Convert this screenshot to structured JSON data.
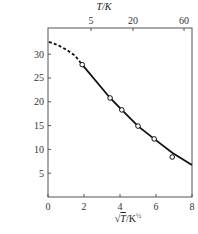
{
  "chart_data": {
    "type": "line",
    "title": "",
    "top_axis": {
      "label": "T/K",
      "ticks": [
        {
          "label": "5",
          "px": 91
        },
        {
          "label": "20",
          "px": 133
        },
        {
          "label": "60",
          "px": 184
        }
      ]
    },
    "xlabel": "√T/K½",
    "xlabel_root": "√",
    "xlabel_T": "T",
    "xlabel_unit": "/K",
    "xlabel_exp": "½",
    "ylabel_prefix": "H",
    "ylabel_sub": "c",
    "ylabel_rest": "/(×",
    "ylabel_frac_num": "10³",
    "ylabel_frac_den": "4π",
    "ylabel_unit": "kA/m)",
    "xlim": [
      0,
      8
    ],
    "ylim": [
      0,
      35.5
    ],
    "xticks": [
      0,
      2,
      4,
      6,
      8
    ],
    "xtick_labels": [
      "0",
      "2",
      "4",
      "6",
      "8"
    ],
    "yticks": [
      5,
      10,
      15,
      20,
      25,
      30
    ],
    "ytick_labels": [
      "5",
      "10",
      "15",
      "20",
      "25",
      "30"
    ],
    "grid": false,
    "series": [
      {
        "name": "measured",
        "style": "open-circle markers",
        "x": [
          1.9,
          3.45,
          4.1,
          5.0,
          5.9,
          6.9
        ],
        "y": [
          27.8,
          20.8,
          18.3,
          14.9,
          12.2,
          8.4
        ]
      },
      {
        "name": "extrapolated fit",
        "style": "dashed",
        "x": [
          0.05,
          0.5,
          1.0,
          1.5,
          1.9
        ],
        "y": [
          32.6,
          32.0,
          31.0,
          29.7,
          27.8
        ]
      },
      {
        "name": "fit",
        "style": "solid",
        "x": [
          1.9,
          3.45,
          4.1,
          5.0,
          5.9,
          6.9,
          8.0
        ],
        "y": [
          27.8,
          20.8,
          18.3,
          14.9,
          12.2,
          9.3,
          6.7
        ]
      }
    ]
  }
}
